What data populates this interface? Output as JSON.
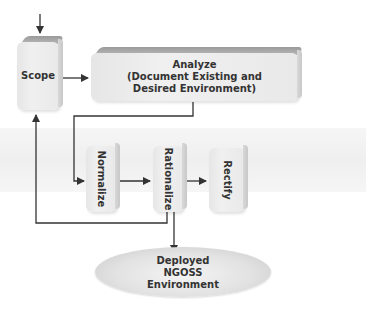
{
  "diagram": {
    "type": "process-flow",
    "nodes": {
      "scope": {
        "label": "Scope"
      },
      "analyze": {
        "line1": "Analyze",
        "line2": "(Document Existing and",
        "line3": "Desired Environment)"
      },
      "normalize": {
        "label": "Normalize"
      },
      "rationalize": {
        "label": "Rationalize"
      },
      "rectify": {
        "label": "Rectify"
      },
      "deployed": {
        "line1": "Deployed",
        "line2": "NGOSS",
        "line3": "Environment"
      }
    },
    "edges": [
      {
        "from": "start",
        "to": "Scope"
      },
      {
        "from": "Scope",
        "to": "Analyze"
      },
      {
        "from": "Analyze",
        "to": "Normalize"
      },
      {
        "from": "Normalize",
        "to": "Rationalize"
      },
      {
        "from": "Rationalize",
        "to": "Rectify"
      },
      {
        "from": "Rationalize",
        "to": "Scope"
      },
      {
        "from": "Rationalize",
        "to": "Deployed NGOSS Environment"
      }
    ],
    "colors": {
      "block": "#ebebeb",
      "block_top": "#a8a8a8",
      "band": "#f2f2f2",
      "line": "#333333"
    }
  }
}
